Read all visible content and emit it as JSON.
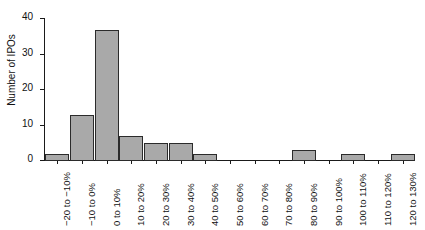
{
  "figure": {
    "background_color": "#ffffff",
    "axis_color": "#1a1a1a",
    "bar_fill_color": "#a9a9a9",
    "bar_edge_color": "#2b2b2b"
  },
  "chart_data": {
    "type": "bar",
    "title": "",
    "xlabel": "",
    "ylabel": "Number of IPOs",
    "ylim": [
      0,
      40
    ],
    "yticks": [
      0,
      10,
      20,
      30,
      40
    ],
    "ytick_labels": [
      "0",
      "10",
      "20",
      "30",
      "40"
    ],
    "grid": false,
    "legend": false,
    "categories": [
      "−20 to −10%",
      "−10 to 0%",
      "0 to 10%",
      "10 to 20%",
      "20 to 30%",
      "30 to 40%",
      "40 to 50%",
      "50 to 60%",
      "60 to 70%",
      "70 to 80%",
      "80 to 90%",
      "90 to 100%",
      "100 to 110%",
      "110 to 120%",
      "120 to 130%"
    ],
    "values": [
      2,
      13,
      37,
      7,
      5,
      5,
      2,
      0,
      0,
      0,
      3,
      0,
      2,
      0,
      2
    ]
  }
}
